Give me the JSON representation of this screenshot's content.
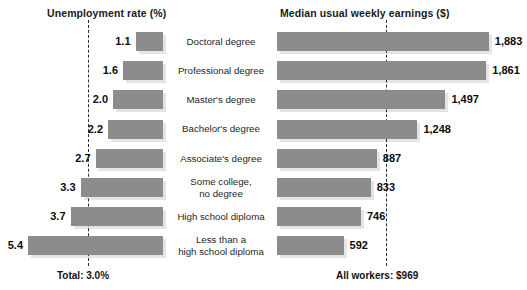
{
  "headers": {
    "left": "Unemployment rate (%)",
    "right": "Median usual weekly earnings ($)"
  },
  "footers": {
    "left": "Total: 3.0%",
    "right": "All workers: $969"
  },
  "style": {
    "bar_color": "#8c8c8c",
    "text_color": "#1a1a1a",
    "background": "#ffffff",
    "ref_line_color": "#2b2b2b"
  },
  "chart_data": {
    "type": "bar",
    "orientation": "horizontal",
    "layout": "butterfly-diverging",
    "grid": false,
    "legend_position": "none",
    "categories": [
      "Doctoral degree",
      "Professional degree",
      "Master's degree",
      "Bachelor's degree",
      "Associate's degree",
      "Some college,\nno degree",
      "High school diploma",
      "Less than a\nhigh school diploma"
    ],
    "series": [
      {
        "name": "Unemployment rate (%)",
        "axis": "left",
        "xlabel": "Unemployment rate (%)",
        "values": [
          1.1,
          1.6,
          2.0,
          2.2,
          2.7,
          3.3,
          3.7,
          5.4
        ],
        "value_labels": [
          "1.1",
          "1.6",
          "2.0",
          "2.2",
          "2.7",
          "3.3",
          "3.7",
          "5.4"
        ],
        "reference_line": {
          "value": 3.0,
          "label": "Total: 3.0%"
        },
        "xlim": [
          0,
          6.5
        ]
      },
      {
        "name": "Median usual weekly earnings ($)",
        "axis": "right",
        "xlabel": "Median usual weekly earnings ($)",
        "values": [
          1883,
          1861,
          1497,
          1248,
          887,
          833,
          746,
          592
        ],
        "value_labels": [
          "1,883",
          "1,861",
          "1,497",
          "1,248",
          "887",
          "833",
          "746",
          "592"
        ],
        "reference_line": {
          "value": 969,
          "label": "All workers: $969"
        },
        "xlim": [
          0,
          1950
        ]
      }
    ]
  },
  "rows": [
    {
      "category": "Doctoral degree",
      "rate": "1.1",
      "earnings": "1,883"
    },
    {
      "category": "Professional degree",
      "rate": "1.6",
      "earnings": "1,861"
    },
    {
      "category": "Master's degree",
      "rate": "2.0",
      "earnings": "1,497"
    },
    {
      "category": "Bachelor's degree",
      "rate": "2.2",
      "earnings": "1,248"
    },
    {
      "category": "Associate's degree",
      "rate": "2.7",
      "earnings": "887"
    },
    {
      "category": "Some college, no degree",
      "category_line1": "Some college,",
      "category_line2": "no degree",
      "rate": "3.3",
      "earnings": "833"
    },
    {
      "category": "High school diploma",
      "rate": "3.7",
      "earnings": "746"
    },
    {
      "category": "Less than a high school diploma",
      "category_line1": "Less than a",
      "category_line2": "high school diploma",
      "rate": "5.4",
      "earnings": "592"
    }
  ]
}
